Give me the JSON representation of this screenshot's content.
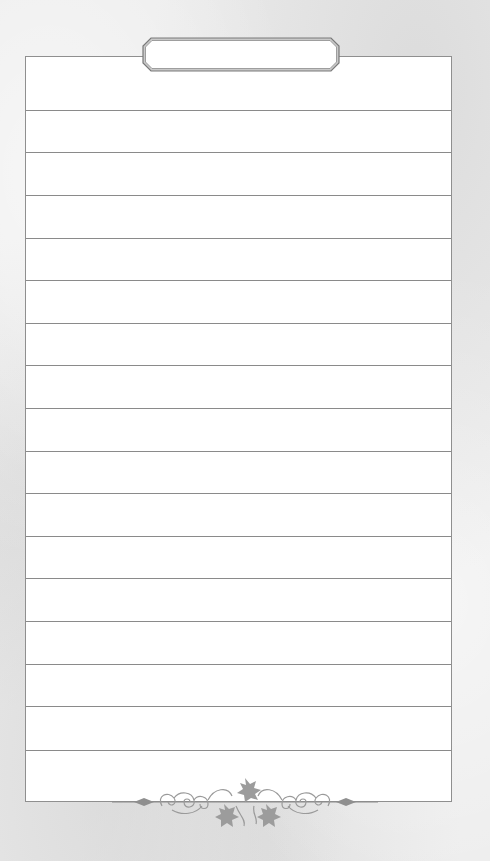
{
  "page": {
    "type": "lined-notepaper",
    "title_plaque_text": "",
    "rule_count": 16,
    "rules_y": [
      54,
      96,
      139,
      182,
      224,
      267,
      309,
      352,
      395,
      437,
      480,
      522,
      565,
      608,
      650,
      694
    ],
    "colors": {
      "background": "#ececec",
      "sheet": "#ffffff",
      "border": "#8f8f8f",
      "rule": "#8a8a8a",
      "ornament": "#9a9a9a"
    },
    "decorations": {
      "top": "title-plaque",
      "bottom": "ivy-leaf-flourish-ornament"
    }
  }
}
